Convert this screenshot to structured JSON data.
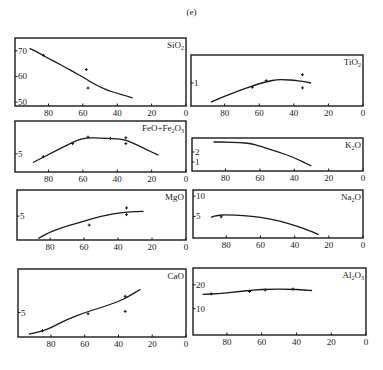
{
  "figure": {
    "label": "(e)"
  },
  "chart_data": [
    {
      "type": "line",
      "title": "SiO2",
      "title_html": [
        "SiO",
        "2",
        ""
      ],
      "xlabel": "",
      "ylabel": "",
      "xlim": [
        100,
        0
      ],
      "x_ticks": [
        80,
        60,
        40,
        20,
        0
      ],
      "y_ticks": [
        70,
        60,
        50
      ],
      "ylim": [
        48.5,
        75
      ],
      "box": [
        15,
        38,
        186,
        106
      ],
      "curve": {
        "x": [
          91,
          85,
          80,
          75,
          70,
          65,
          60,
          55,
          50,
          45,
          40,
          35,
          31
        ],
        "y": [
          71,
          69,
          67,
          65.3,
          63.5,
          61.6,
          59.8,
          57.7,
          55.9,
          54.5,
          53.4,
          52.5,
          51.6
        ]
      },
      "points": {
        "x": [
          83,
          58,
          57
        ],
        "y": [
          68.3,
          62.7,
          55.5
        ]
      }
    },
    {
      "type": "line",
      "title": "TiO2",
      "title_html": [
        "TiO",
        "2",
        ""
      ],
      "xlabel": "",
      "ylabel": "",
      "xlim": [
        100,
        0
      ],
      "x_ticks": [
        80,
        60,
        40,
        20,
        0
      ],
      "y_ticks": [
        1
      ],
      "ylim": [
        0.3,
        1.85
      ],
      "box": [
        191,
        55,
        363,
        106
      ],
      "curve": {
        "x": [
          88,
          80,
          70,
          60,
          55,
          50,
          45,
          40,
          35,
          30
        ],
        "y": [
          0.42,
          0.6,
          0.8,
          0.98,
          1.05,
          1.1,
          1.1,
          1.08,
          1.05,
          1.0
        ]
      },
      "points": {
        "x": [
          64,
          56,
          35,
          35
        ],
        "y": [
          0.87,
          1.07,
          1.25,
          0.85
        ]
      }
    },
    {
      "type": "line",
      "title": "FeO+Fe2O3",
      "title_html": [
        "FeO+Fe",
        "2",
        "O3"
      ],
      "xlabel": "",
      "ylabel": "",
      "xlim": [
        100,
        0
      ],
      "x_ticks": [
        80,
        60,
        40,
        20,
        0
      ],
      "y_ticks": [
        5
      ],
      "ylim": [
        2.5,
        9.5
      ],
      "box": [
        15,
        121,
        186,
        172
      ],
      "curve": {
        "x": [
          89,
          80,
          70,
          63,
          58,
          50,
          42,
          35,
          30,
          24,
          16
        ],
        "y": [
          3.8,
          4.9,
          6.1,
          6.9,
          7.2,
          7.15,
          7.1,
          6.9,
          6.4,
          5.7,
          4.8
        ]
      },
      "points": {
        "x": [
          83,
          66,
          57,
          44,
          35,
          35
        ],
        "y": [
          4.6,
          6.4,
          7.3,
          7.1,
          7.2,
          6.4
        ]
      }
    },
    {
      "type": "line",
      "title": "K2O",
      "title_html": [
        "K",
        "2",
        "O"
      ],
      "xlabel": "",
      "ylabel": "",
      "xlim": [
        100,
        0
      ],
      "x_ticks": [
        80,
        60,
        40,
        20,
        0
      ],
      "y_ticks": [
        2,
        1
      ],
      "ylim": [
        0.1,
        3.4
      ],
      "box": [
        192,
        138,
        363,
        171
      ],
      "curve": {
        "x": [
          87,
          80,
          72,
          65,
          60,
          50,
          40,
          30
        ],
        "y": [
          3.0,
          3.0,
          2.95,
          2.85,
          2.6,
          2.05,
          1.45,
          0.6
        ]
      },
      "points": {
        "x": [],
        "y": []
      }
    },
    {
      "type": "line",
      "title": "MgO",
      "title_html": [
        "MgO",
        "",
        ""
      ],
      "xlabel": "",
      "ylabel": "",
      "xlim": [
        100,
        0
      ],
      "x_ticks": [
        80,
        60,
        40,
        20,
        0
      ],
      "y_ticks": [
        5
      ],
      "ylim": [
        1.8,
        8.5
      ],
      "box": [
        17,
        190,
        186,
        240
      ],
      "curve": {
        "x": [
          87,
          80,
          70,
          60,
          50,
          40,
          35,
          25
        ],
        "y": [
          2.0,
          2.9,
          3.7,
          4.3,
          5.0,
          5.4,
          5.55,
          5.65
        ]
      },
      "points": {
        "x": [
          57,
          35,
          35
        ],
        "y": [
          3.8,
          6.1,
          5.2
        ]
      }
    },
    {
      "type": "line",
      "title": "Na2O",
      "title_html": [
        "Na",
        "2",
        "O"
      ],
      "xlabel": "",
      "ylabel": "",
      "xlim": [
        100,
        0
      ],
      "x_ticks": [
        80,
        60,
        40,
        20,
        0
      ],
      "y_ticks": [
        10,
        5
      ],
      "ylim": [
        -0.3,
        11.5
      ],
      "box": [
        193,
        190,
        363,
        238
      ],
      "curve": {
        "x": [
          89,
          85,
          80,
          70,
          60,
          50,
          40,
          30,
          26
        ],
        "y": [
          4.8,
          5.3,
          5.4,
          5.2,
          4.8,
          4.0,
          2.8,
          1.3,
          0.5
        ]
      },
      "points": {
        "x": [
          83
        ],
        "y": [
          4.9
        ]
      }
    },
    {
      "type": "line",
      "title": "CaO",
      "title_html": [
        "CaO",
        "",
        ""
      ],
      "xlabel": "",
      "ylabel": "",
      "xlim": [
        100,
        0
      ],
      "x_ticks": [
        80,
        60,
        40,
        20,
        0
      ],
      "y_ticks": [
        5
      ],
      "ylim": [
        0.8,
        12.5
      ],
      "box": [
        18,
        269,
        186,
        337
      ],
      "curve": {
        "x": [
          93,
          85,
          80,
          70,
          60,
          50,
          40,
          35,
          27
        ],
        "y": [
          1.3,
          1.8,
          2.4,
          3.9,
          5.0,
          5.9,
          6.9,
          7.6,
          9.0
        ]
      },
      "points": {
        "x": [
          85,
          58,
          36,
          36
        ],
        "y": [
          1.9,
          4.8,
          7.8,
          5.2
        ]
      }
    },
    {
      "type": "line",
      "title": "Al2O3",
      "title_html": [
        "Al",
        "2",
        "O3"
      ],
      "xlabel": "",
      "ylabel": "",
      "xlim": [
        100,
        0
      ],
      "x_ticks": [
        80,
        60,
        40,
        20,
        0
      ],
      "y_ticks": [
        20,
        10
      ],
      "ylim": [
        -1,
        27
      ],
      "box": [
        193,
        268,
        366,
        335
      ],
      "curve": {
        "x": [
          94,
          85,
          75,
          65,
          55,
          45,
          35,
          31
        ],
        "y": [
          16.0,
          16.3,
          17.0,
          17.8,
          18.2,
          18.2,
          17.8,
          17.6
        ]
      },
      "points": {
        "x": [
          89,
          67,
          58,
          42
        ],
        "y": [
          16.2,
          17.2,
          17.8,
          18.2
        ]
      }
    }
  ]
}
